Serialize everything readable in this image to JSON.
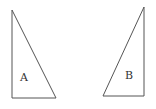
{
  "diagram": {
    "stroke_color": "#555555",
    "background": "#ffffff",
    "shapes": [
      {
        "id": "A",
        "type": "right-triangle",
        "label": "A",
        "vertices": [
          [
            12,
            10
          ],
          [
            12,
            98
          ],
          [
            56,
            98
          ]
        ],
        "label_pos": [
          24,
          80
        ]
      },
      {
        "id": "B",
        "type": "right-triangle",
        "label": "B",
        "vertices": [
          [
            144,
            7
          ],
          [
            144,
            96
          ],
          [
            103,
            96
          ]
        ],
        "label_pos": [
          129,
          79
        ]
      }
    ]
  }
}
